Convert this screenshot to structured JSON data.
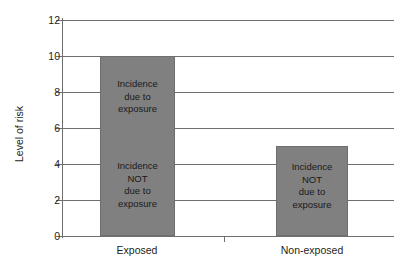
{
  "chart_data": {
    "type": "bar",
    "title": "",
    "subtitle": "",
    "xlabel": "",
    "ylabel": "Level of risk",
    "categories": [
      "Exposed",
      "Non-exposed"
    ],
    "values": [
      10,
      5
    ],
    "ylim": [
      0,
      12
    ],
    "ytick_values": [
      12,
      10,
      8,
      6,
      4,
      2,
      0
    ],
    "ytick_labels": [
      "12",
      "10",
      "8",
      "6",
      "4",
      "2",
      "0"
    ],
    "ytick_interval": 2,
    "grid": true,
    "grid_axis": "y",
    "legend": false,
    "legend_position": "none",
    "bar_color": "#808080",
    "bar_edge_color": "#6e6e6e",
    "grid_color": "#6f6f6f",
    "axis_color": "#6f6f6f",
    "text_color": "#231f20",
    "background_color": "#ffffff",
    "annotations": [
      {
        "category": "Exposed",
        "segment": "attributable",
        "text": "Incidence\ndue to\nexposure",
        "value_range": [
          5,
          10
        ],
        "center_value": 8
      },
      {
        "category": "Exposed",
        "segment": "baseline",
        "text": "Incidence\nNOT\ndue to\nexposure",
        "value_range": [
          0,
          5
        ],
        "center_value": 2.6
      },
      {
        "category": "Non-exposed",
        "segment": "baseline",
        "text": "Incidence\nNOT\ndue to\nexposure",
        "value_range": [
          0,
          5
        ],
        "center_value": 2.6
      }
    ]
  },
  "axis": {
    "y_title": "Level of risk",
    "ticks": [
      {
        "label": "12",
        "value": 12,
        "y": 20
      },
      {
        "label": "10",
        "value": 10,
        "y": 56
      },
      {
        "label": "8",
        "value": 8,
        "y": 92
      },
      {
        "label": "6",
        "value": 6,
        "y": 128
      },
      {
        "label": "4",
        "value": 4,
        "y": 164
      },
      {
        "label": "2",
        "value": 2,
        "y": 200
      },
      {
        "label": "0",
        "value": 0,
        "y": 236
      }
    ]
  },
  "bars": [
    {
      "label": "Exposed",
      "value": 10,
      "left": 100,
      "width": 75,
      "top": 56,
      "height": 180,
      "label_center_x": 137,
      "notes": [
        {
          "text": "Incidence\ndue to\nexposure",
          "top": 78,
          "left": 100,
          "width": 75
        },
        {
          "text": "Incidence\nNOT\ndue to\nexposure",
          "top": 160,
          "left": 100,
          "width": 75
        }
      ]
    },
    {
      "label": "Non-exposed",
      "value": 5,
      "left": 276,
      "width": 72,
      "top": 146,
      "height": 90,
      "label_center_x": 312,
      "notes": [
        {
          "text": "Incidence\nNOT\ndue to\nexposure",
          "top": 161,
          "left": 276,
          "width": 72
        }
      ]
    }
  ],
  "x_divider_tick": {
    "x": 224,
    "y": 236
  }
}
